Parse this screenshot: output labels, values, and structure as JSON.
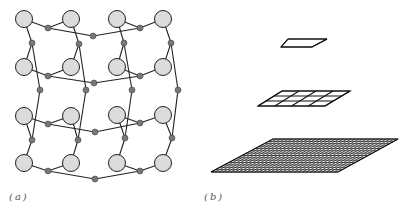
{
  "panels": [
    {
      "id": "a",
      "label": "(a)",
      "description": "network of large nodes connected through small nodes",
      "big_nodes": [
        [
          24,
          19
        ],
        [
          71,
          19
        ],
        [
          117,
          19
        ],
        [
          163,
          19
        ],
        [
          24,
          67
        ],
        [
          71,
          67
        ],
        [
          117,
          67
        ],
        [
          163,
          67
        ],
        [
          24,
          116
        ],
        [
          71,
          116
        ],
        [
          117,
          115
        ],
        [
          163,
          115
        ],
        [
          24,
          163
        ],
        [
          71,
          163
        ],
        [
          117,
          163
        ],
        [
          163,
          163
        ]
      ],
      "small_nodes": [
        [
          48,
          28
        ],
        [
          140,
          28
        ],
        [
          93,
          36
        ],
        [
          32,
          43
        ],
        [
          79,
          44
        ],
        [
          124,
          43
        ],
        [
          171,
          43
        ],
        [
          48,
          76
        ],
        [
          140,
          76
        ],
        [
          94,
          83
        ],
        [
          40,
          90
        ],
        [
          86,
          90
        ],
        [
          132,
          90
        ],
        [
          178,
          90
        ],
        [
          48,
          124
        ],
        [
          140,
          123
        ],
        [
          95,
          132
        ],
        [
          32,
          140
        ],
        [
          78,
          140
        ],
        [
          125,
          138
        ],
        [
          172,
          138
        ],
        [
          48,
          171
        ],
        [
          140,
          171
        ],
        [
          95,
          179
        ]
      ],
      "edges": [
        [
          [
            24,
            19
          ],
          [
            48,
            28
          ]
        ],
        [
          [
            71,
            19
          ],
          [
            48,
            28
          ]
        ],
        [
          [
            48,
            28
          ],
          [
            93,
            36
          ]
        ],
        [
          [
            93,
            36
          ],
          [
            140,
            28
          ]
        ],
        [
          [
            117,
            19
          ],
          [
            140,
            28
          ]
        ],
        [
          [
            163,
            19
          ],
          [
            140,
            28
          ]
        ],
        [
          [
            24,
            19
          ],
          [
            32,
            43
          ]
        ],
        [
          [
            32,
            43
          ],
          [
            24,
            67
          ]
        ],
        [
          [
            32,
            43
          ],
          [
            40,
            90
          ]
        ],
        [
          [
            71,
            19
          ],
          [
            79,
            44
          ]
        ],
        [
          [
            79,
            44
          ],
          [
            71,
            67
          ]
        ],
        [
          [
            79,
            44
          ],
          [
            86,
            90
          ]
        ],
        [
          [
            117,
            19
          ],
          [
            124,
            43
          ]
        ],
        [
          [
            124,
            43
          ],
          [
            117,
            67
          ]
        ],
        [
          [
            124,
            43
          ],
          [
            132,
            90
          ]
        ],
        [
          [
            163,
            19
          ],
          [
            171,
            43
          ]
        ],
        [
          [
            171,
            43
          ],
          [
            163,
            67
          ]
        ],
        [
          [
            171,
            43
          ],
          [
            178,
            90
          ]
        ],
        [
          [
            24,
            67
          ],
          [
            48,
            76
          ]
        ],
        [
          [
            71,
            67
          ],
          [
            48,
            76
          ]
        ],
        [
          [
            48,
            76
          ],
          [
            94,
            83
          ]
        ],
        [
          [
            117,
            67
          ],
          [
            140,
            76
          ]
        ],
        [
          [
            163,
            67
          ],
          [
            140,
            76
          ]
        ],
        [
          [
            140,
            76
          ],
          [
            94,
            83
          ]
        ],
        [
          [
            40,
            90
          ],
          [
            32,
            140
          ]
        ],
        [
          [
            86,
            90
          ],
          [
            78,
            140
          ]
        ],
        [
          [
            132,
            90
          ],
          [
            125,
            138
          ]
        ],
        [
          [
            178,
            90
          ],
          [
            172,
            138
          ]
        ],
        [
          [
            24,
            116
          ],
          [
            48,
            124
          ]
        ],
        [
          [
            71,
            116
          ],
          [
            48,
            124
          ]
        ],
        [
          [
            48,
            124
          ],
          [
            95,
            132
          ]
        ],
        [
          [
            117,
            115
          ],
          [
            140,
            123
          ]
        ],
        [
          [
            163,
            115
          ],
          [
            140,
            123
          ]
        ],
        [
          [
            140,
            123
          ],
          [
            95,
            132
          ]
        ],
        [
          [
            24,
            116
          ],
          [
            32,
            140
          ]
        ],
        [
          [
            32,
            140
          ],
          [
            24,
            163
          ]
        ],
        [
          [
            71,
            116
          ],
          [
            78,
            140
          ]
        ],
        [
          [
            78,
            140
          ],
          [
            71,
            163
          ]
        ],
        [
          [
            117,
            115
          ],
          [
            125,
            138
          ]
        ],
        [
          [
            125,
            138
          ],
          [
            117,
            163
          ]
        ],
        [
          [
            163,
            115
          ],
          [
            172,
            138
          ]
        ],
        [
          [
            172,
            138
          ],
          [
            163,
            163
          ]
        ],
        [
          [
            24,
            163
          ],
          [
            48,
            171
          ]
        ],
        [
          [
            71,
            163
          ],
          [
            48,
            171
          ]
        ],
        [
          [
            48,
            171
          ],
          [
            95,
            179
          ]
        ],
        [
          [
            117,
            163
          ],
          [
            140,
            171
          ]
        ],
        [
          [
            163,
            163
          ],
          [
            140,
            171
          ]
        ],
        [
          [
            140,
            171
          ],
          [
            95,
            179
          ]
        ]
      ],
      "colors": {
        "big_fill": "#dcdcdc",
        "small_fill": "#777777",
        "stroke": "#222222"
      }
    },
    {
      "id": "b",
      "label": "(b)",
      "description": "three stacked grids of increasing resolution",
      "layers": [
        {
          "name": "top",
          "corners": [
            [
              281,
              47
            ],
            [
              288,
              39
            ],
            [
              327,
              39
            ],
            [
              312,
              47
            ]
          ],
          "cols": 1,
          "rows": 1
        },
        {
          "name": "middle",
          "corners": [
            [
              258,
              106
            ],
            [
              282,
              91
            ],
            [
              350,
              91
            ],
            [
              325,
              106
            ]
          ],
          "cols": 4,
          "rows": 3
        },
        {
          "name": "bottom",
          "corners": [
            [
              211,
              172
            ],
            [
              273,
              139
            ],
            [
              398,
              139
            ],
            [
              338,
              172
            ]
          ],
          "cols": 32,
          "rows": 14
        }
      ]
    }
  ]
}
